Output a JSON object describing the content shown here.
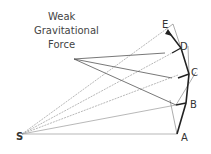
{
  "title_lines": [
    "Weak",
    "Gravitational",
    "Force"
  ],
  "points": {
    "S": "S",
    "A": "A",
    "B": "B",
    "C": "C",
    "D": "D",
    "E": "E"
  },
  "colors": {
    "stroke": "#555555",
    "orbit": "#222222",
    "dashed": "#aaaaaa"
  }
}
